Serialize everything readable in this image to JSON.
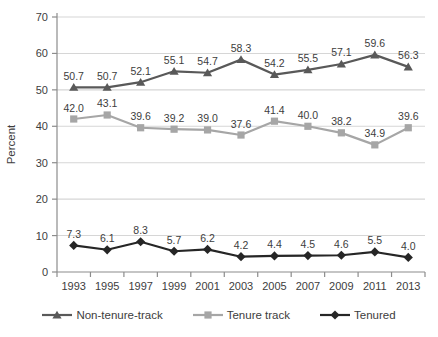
{
  "figure": {
    "background": "#ffffff"
  },
  "colors": {
    "gridline": "#d6d6d6",
    "axis": "#8c8c8c",
    "text": "#3d3d3d",
    "data_label": "#3d3d3d"
  },
  "chart_data": {
    "type": "line",
    "title": "",
    "xlabel": "",
    "ylabel": "Percent",
    "ylim": [
      0,
      70
    ],
    "ytick_step": 10,
    "grid": true,
    "legend_position": "bottom",
    "data_labels": true,
    "categories": [
      "1993",
      "1995",
      "1997",
      "1999",
      "2001",
      "2003",
      "2005",
      "2007",
      "2009",
      "2011",
      "2013"
    ],
    "series": [
      {
        "name": "Non-tenure-track",
        "marker": "triangle",
        "color": "#595959",
        "values": [
          50.7,
          50.7,
          52.1,
          55.1,
          54.7,
          58.3,
          54.2,
          55.5,
          57.1,
          59.6,
          56.3
        ]
      },
      {
        "name": "Tenure track",
        "marker": "square",
        "color": "#a6a6a6",
        "values": [
          42.0,
          43.1,
          39.6,
          39.2,
          39.0,
          37.6,
          41.4,
          40.0,
          38.2,
          34.9,
          39.6
        ]
      },
      {
        "name": "Tenured",
        "marker": "diamond",
        "color": "#262626",
        "values": [
          7.3,
          6.1,
          8.3,
          5.7,
          6.2,
          4.2,
          4.4,
          4.5,
          4.6,
          5.5,
          4.0
        ]
      }
    ]
  }
}
